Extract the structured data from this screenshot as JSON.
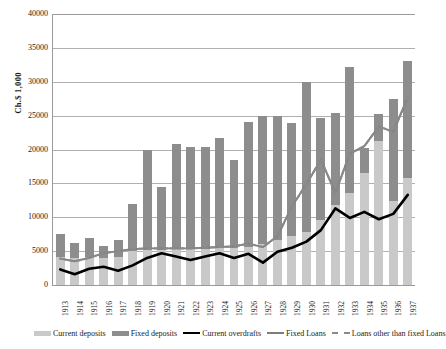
{
  "chart_data": {
    "type": "bar",
    "title": "",
    "xlabel": "",
    "ylabel": "Ch.$ 1,000",
    "ylim": [
      0,
      40000
    ],
    "ytick_labels": [
      "40000",
      "35000",
      "30000",
      "25000",
      "20000",
      "15000",
      "10000",
      "5000",
      "0"
    ],
    "yticks": [
      40000,
      35000,
      30000,
      25000,
      20000,
      15000,
      10000,
      5000,
      0
    ],
    "grid": true,
    "legend_position": "bottom",
    "categories": [
      "1913",
      "1914",
      "1915",
      "1916",
      "1917",
      "1918",
      "1919",
      "1920",
      "1921",
      "1922",
      "1923",
      "1924",
      "1925",
      "1926",
      "1927",
      "1928",
      "1929",
      "1930",
      "1931",
      "1932",
      "1933",
      "1934",
      "1935",
      "1936",
      "1937"
    ],
    "stacked_series": [
      {
        "name": "Current deposits",
        "color": "#c9c9c9",
        "values": [
          4200,
          4000,
          4100,
          4000,
          4200,
          5000,
          5200,
          5200,
          5300,
          5300,
          5300,
          5400,
          5500,
          5600,
          6000,
          6600,
          7200,
          7800,
          9600,
          11800,
          13600,
          16600,
          21200,
          12400,
          15800
        ]
      },
      {
        "name": "Fixed deposits",
        "color": "#8d8d8d",
        "values": [
          3300,
          2200,
          2800,
          1800,
          2400,
          7000,
          14800,
          9300,
          15500,
          15000,
          15100,
          16300,
          13000,
          18500,
          18900,
          18300,
          16700,
          22200,
          15000,
          13600,
          18600,
          3600,
          4100,
          15100,
          17200
        ]
      }
    ],
    "stacked_totals": [
      7500,
      6200,
      6900,
      5800,
      6600,
      12000,
      20000,
      14500,
      20800,
      20300,
      20400,
      21700,
      18500,
      24100,
      24900,
      24900,
      23900,
      30000,
      24600,
      25400,
      32200,
      20200,
      25300,
      27500,
      33000
    ],
    "line_series": [
      {
        "name": "Current overdrafts",
        "color": "#000000",
        "style": "solid",
        "values": [
          2300,
          1600,
          2400,
          2700,
          2100,
          2900,
          4000,
          4700,
          4200,
          3700,
          4200,
          4700,
          4000,
          4600,
          3300,
          4900,
          5500,
          6400,
          8100,
          11300,
          9900,
          10800,
          9700,
          10500,
          13300
        ]
      },
      {
        "name": "Fixed Loans",
        "color": "#7d7d7d",
        "style": "solid",
        "values": [
          3900,
          3500,
          4000,
          4700,
          5000,
          5300,
          5400,
          5400,
          5400,
          5400,
          5500,
          5600,
          5700,
          6100,
          5600,
          7200,
          11600,
          14900,
          18500,
          13600,
          19400,
          20500,
          23400,
          22600,
          27700
        ]
      },
      {
        "name": "Loans other than fixed Loans",
        "color": "#8a8a8a",
        "style": "dashed",
        "values": [
          3900,
          3500,
          4000,
          4700,
          5000,
          5300,
          5400,
          5400,
          5400,
          5400,
          5500,
          5600,
          5700,
          6100,
          5600,
          7200,
          11600,
          14900,
          18500,
          13600,
          19400,
          20500,
          23400,
          22600,
          27700
        ]
      }
    ]
  },
  "legend": {
    "items": [
      {
        "label": "Current deposits",
        "swatch": "cur"
      },
      {
        "label": "Fixed deposits",
        "swatch": "fix"
      },
      {
        "label": "Current overdrafts",
        "swatch": "line"
      },
      {
        "label": "Fixed Loans",
        "swatch": "line2"
      },
      {
        "label": "Loans other than fixed Loans",
        "swatch": "dash"
      }
    ]
  }
}
